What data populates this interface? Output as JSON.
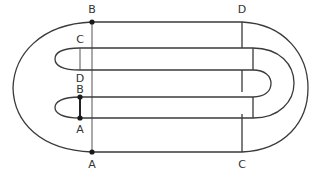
{
  "diagram": {
    "colors": {
      "stroke": "#3a3a3a",
      "dot": "#1a1a1a",
      "background": "#ffffff"
    },
    "labels": [
      {
        "id": "top-left-B",
        "text": "B",
        "x": 92,
        "y": 4
      },
      {
        "id": "top-right-D",
        "text": "D",
        "x": 242,
        "y": 4
      },
      {
        "id": "upper-band-C",
        "text": "C",
        "x": 80,
        "y": 36
      },
      {
        "id": "upper-band-D",
        "text": "D",
        "x": 80,
        "y": 73
      },
      {
        "id": "lower-band-B",
        "text": "B",
        "x": 80,
        "y": 81
      },
      {
        "id": "lower-band-A",
        "text": "A",
        "x": 80,
        "y": 123
      },
      {
        "id": "bottom-left-A",
        "text": "A",
        "x": 92,
        "y": 161
      },
      {
        "id": "bottom-right-C",
        "text": "C",
        "x": 242,
        "y": 161
      }
    ],
    "points": [
      {
        "id": "B-top",
        "x": 92,
        "y": 22
      },
      {
        "id": "B-lower",
        "x": 80,
        "y": 97
      },
      {
        "id": "A-lower",
        "x": 80,
        "y": 118
      },
      {
        "id": "A-bottom",
        "x": 92,
        "y": 152
      }
    ]
  }
}
